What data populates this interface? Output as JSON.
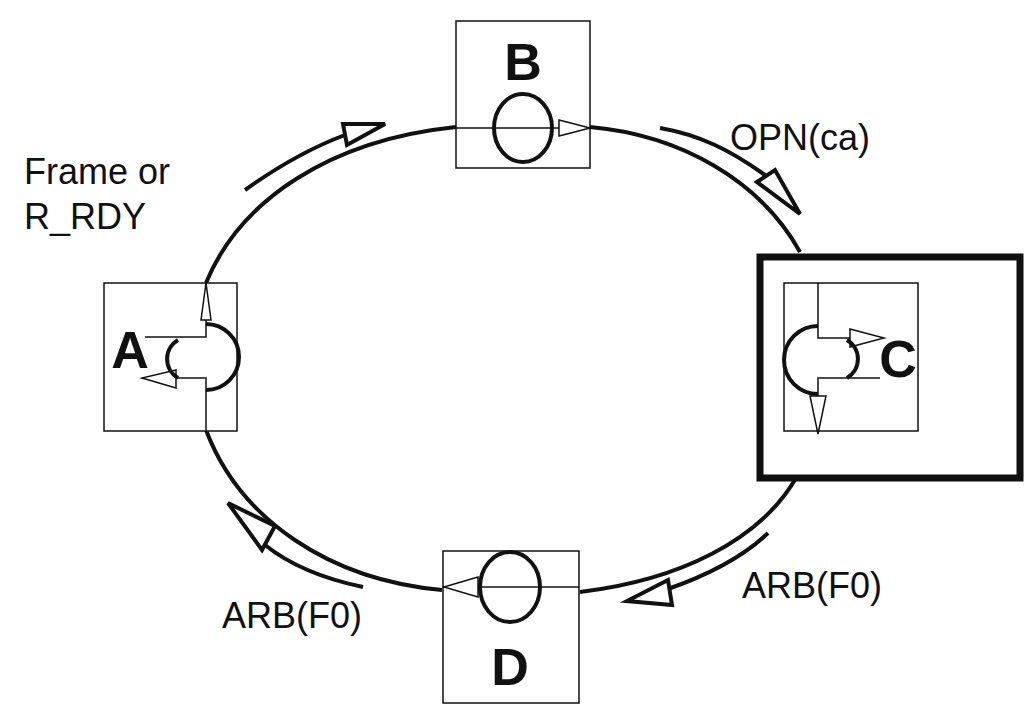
{
  "diagram": {
    "type": "ring-topology",
    "nodes": [
      {
        "id": "A",
        "label": "A",
        "symbol": "bypass-half-circle"
      },
      {
        "id": "B",
        "label": "B",
        "symbol": "circle-through"
      },
      {
        "id": "C",
        "label": "C",
        "symbol": "bypass-half-circle",
        "highlighted": true
      },
      {
        "id": "D",
        "label": "D",
        "symbol": "circle-through"
      }
    ],
    "edges": [
      {
        "from": "A",
        "to": "B",
        "label_line1": "Frame or",
        "label_line2": "R_RDY"
      },
      {
        "from": "B",
        "to": "C",
        "label": "OPN(ca)"
      },
      {
        "from": "C",
        "to": "D",
        "label": "ARB(F0)"
      },
      {
        "from": "D",
        "to": "A",
        "label": "ARB(F0)"
      }
    ],
    "colors": {
      "stroke": "#111111",
      "background": "#ffffff"
    }
  }
}
